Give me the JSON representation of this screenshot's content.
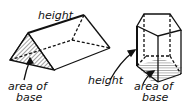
{
  "figures": [
    {
      "shape": "triangular-prism",
      "labels": {
        "height": "height",
        "base_line1": "area of",
        "base_line2": "base"
      }
    },
    {
      "shape": "pentagonal-prism",
      "labels": {
        "height": "height",
        "base_line1": "area of",
        "base_line2": "base"
      }
    }
  ]
}
